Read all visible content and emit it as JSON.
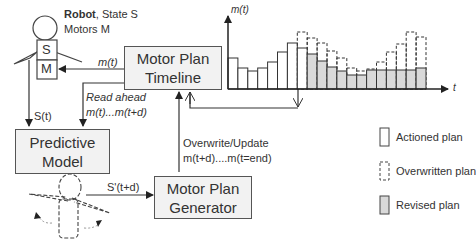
{
  "robot": {
    "title_bold": "Robot",
    "title_rest": ", State S",
    "motors": "Motors M",
    "state_block": "S",
    "motor_block": "M"
  },
  "boxes": {
    "timeline": [
      "Motor Plan",
      "Timeline"
    ],
    "predictive": [
      "Predictive",
      "Model"
    ],
    "generator": [
      "Motor Plan",
      "Generator"
    ]
  },
  "arrows": {
    "m_t": "m(t)",
    "s_t": "S(t)",
    "read_ahead_1": "Read ahead",
    "read_ahead_2": "m(t)...m(t+d)",
    "s_prime": "S'(t+d)",
    "overwrite_1": "Overwrite/Update",
    "overwrite_2": "m(t+d)....m(t=end)"
  },
  "legend": [
    {
      "label": "Actioned plan",
      "style": "solid-white"
    },
    {
      "label": "Overwritten  plan",
      "style": "dashed-white"
    },
    {
      "label": "Revised plan",
      "style": "solid-grey"
    }
  ],
  "colors": {
    "line": "#333333",
    "box_fill": "#f2f2f2",
    "revised_fill": "#d9d9d9",
    "actioned_fill": "#ffffff"
  },
  "chart_data": {
    "type": "bar",
    "title": "",
    "xlabel": "t",
    "ylabel": "m(t)",
    "categories": [
      1,
      2,
      3,
      4,
      5,
      6,
      7,
      8,
      9,
      10,
      11,
      12,
      13,
      14,
      15,
      16,
      17,
      18,
      19,
      20
    ],
    "series": [
      {
        "name": "Actioned plan",
        "values": [
          31,
          21,
          18,
          21,
          27,
          37,
          46,
          41,
          null,
          null,
          null,
          null,
          null,
          null,
          null,
          null,
          null,
          null,
          null,
          null
        ]
      },
      {
        "name": "Revised plan",
        "values": [
          null,
          null,
          null,
          null,
          null,
          null,
          null,
          null,
          35,
          28,
          22,
          18,
          14,
          14,
          19,
          19,
          19,
          19,
          19,
          21
        ]
      },
      {
        "name": "Overwritten  plan",
        "values": [
          null,
          null,
          null,
          null,
          null,
          null,
          null,
          57,
          51,
          46,
          38,
          31,
          21,
          18,
          20,
          27,
          37,
          45,
          57,
          52
        ]
      }
    ],
    "current_time_index": 8,
    "axes": {
      "x_arrow": true,
      "y_arrow": true,
      "ticks": false
    },
    "legend_position": "right-bottom",
    "grid": false
  }
}
